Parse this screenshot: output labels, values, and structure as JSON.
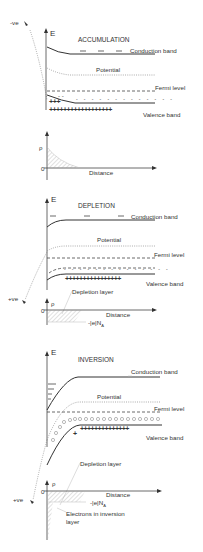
{
  "panels": [
    {
      "title": "ACCUMULATION",
      "axis_label": "E",
      "gate_voltage": "-ve",
      "conduction_band": "Conduction band",
      "potential": "Potential",
      "fermi_level": "Fermi level",
      "valence_band": "Valence band",
      "rho_label": "ρ",
      "zero_label": "0",
      "distance_label": "Distance"
    },
    {
      "title": "DEPLETION",
      "axis_label": "E",
      "gate_voltage": "+ve",
      "conduction_band": "Conduction band",
      "potential": "Potential",
      "fermi_level": "Fermi level",
      "valence_band": "Valence band",
      "depletion_layer": "Depletion layer",
      "rho_label": "ρ",
      "zero_label": "0",
      "distance_label": "Distance",
      "charge_label": "-|e|N",
      "charge_sub": "A"
    },
    {
      "title": "INVERSION",
      "axis_label": "E",
      "gate_voltage": "+ve",
      "conduction_band": "Conduction band",
      "potential": "Potential",
      "fermi_level": "Fermi level",
      "valence_band": "Valence band",
      "depletion_layer": "Depletion layer",
      "rho_label": "ρ",
      "zero_label": "0",
      "distance_label": "Distance",
      "charge_label": "-|e|N",
      "charge_sub": "A",
      "inversion_label_1": "Electrons in inversion",
      "inversion_label_2": "layer"
    }
  ],
  "symbols": {
    "plus": "+",
    "minus": "-"
  }
}
